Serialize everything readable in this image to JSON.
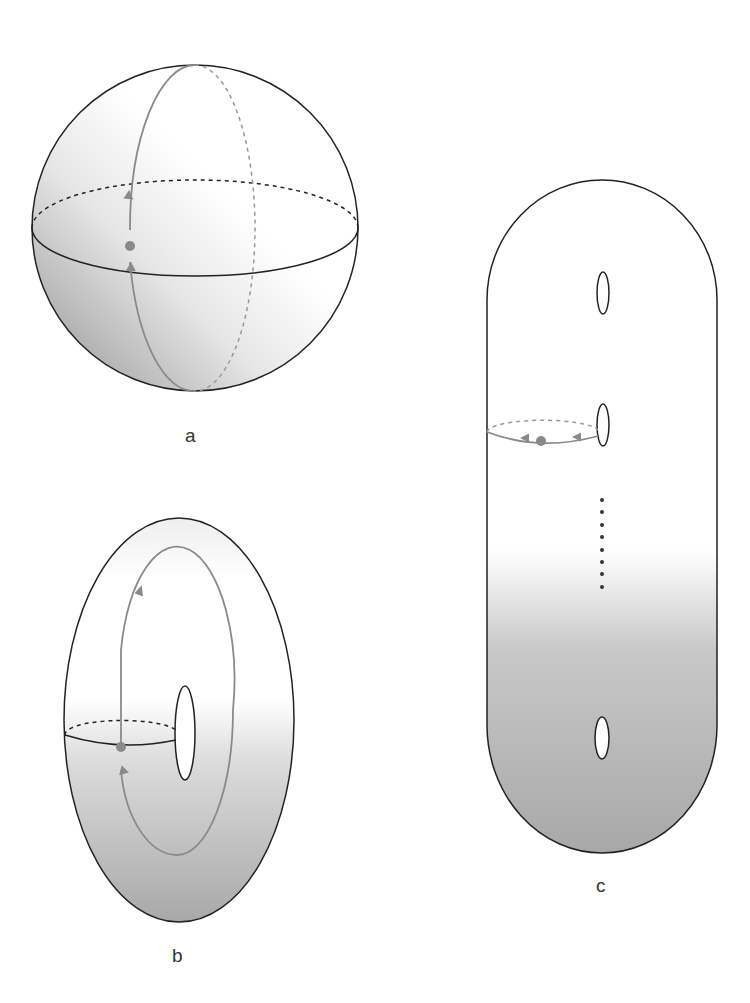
{
  "figure": {
    "panels": [
      {
        "id": "a",
        "label": "a",
        "surface": "sphere"
      },
      {
        "id": "b",
        "label": "b",
        "surface": "torus"
      },
      {
        "id": "c",
        "label": "c",
        "surface": "multi-holed surface"
      }
    ]
  },
  "colors": {
    "outline": "#222222",
    "path": "#8a8a8a",
    "point": "#8a8a8a",
    "shade": "#b8b8b8"
  }
}
